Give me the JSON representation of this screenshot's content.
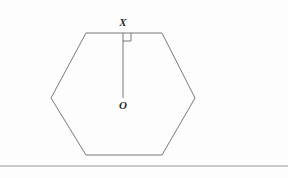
{
  "figure": {
    "background_color": "#fdfdfd",
    "stroke_color": "#6a6a6a",
    "baseline_color": "#8a8a8a",
    "label_color": "#2b2b2b",
    "stroke_width": 0.9,
    "labels": {
      "apex_point": "X",
      "center_point": "O"
    },
    "shapes": {
      "hexagon": {
        "name": "hexagon",
        "sides": 6,
        "points": "86,33 162,33 195,98 162,155 86,155 51,98"
      },
      "apothem": {
        "name": "apothem-segment",
        "x1": 123,
        "y1": 33,
        "x2": 123,
        "y2": 98
      },
      "right_angle_marker": {
        "name": "right-angle-marker",
        "points": "123,41 131,41 131,33",
        "size": 8
      },
      "ground_line": {
        "name": "ground-baseline",
        "x1": 0,
        "y1": 166,
        "x2": 288,
        "y2": 166
      }
    }
  }
}
